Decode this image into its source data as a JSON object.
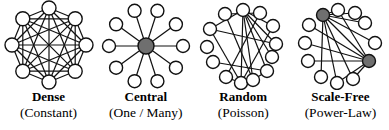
{
  "figure": {
    "colors": {
      "node_fill": "#ffffff",
      "node_stroke": "#111111",
      "edge_stroke": "#111111",
      "hub_fill": "#6f6f6f"
    },
    "panels": [
      {
        "id": "dense",
        "label": "Dense",
        "sublabel": "(Constant)",
        "graph": {
          "width": 96,
          "height": 90,
          "node_r": 7,
          "nodes": [
            {
              "x": 48,
              "y": 8
            },
            {
              "x": 74.2,
              "y": 18.8
            },
            {
              "x": 85,
              "y": 45
            },
            {
              "x": 74.2,
              "y": 71.2
            },
            {
              "x": 48,
              "y": 82
            },
            {
              "x": 21.8,
              "y": 71.2
            },
            {
              "x": 11,
              "y": 45
            },
            {
              "x": 21.8,
              "y": 18.8
            }
          ],
          "edges": [
            [
              0,
              1
            ],
            [
              0,
              2
            ],
            [
              0,
              3
            ],
            [
              0,
              4
            ],
            [
              0,
              5
            ],
            [
              0,
              6
            ],
            [
              0,
              7
            ],
            [
              1,
              2
            ],
            [
              1,
              3
            ],
            [
              1,
              4
            ],
            [
              1,
              5
            ],
            [
              1,
              6
            ],
            [
              1,
              7
            ],
            [
              2,
              3
            ],
            [
              2,
              4
            ],
            [
              2,
              5
            ],
            [
              2,
              6
            ],
            [
              2,
              7
            ],
            [
              3,
              4
            ],
            [
              3,
              5
            ],
            [
              3,
              6
            ],
            [
              3,
              7
            ],
            [
              4,
              5
            ],
            [
              4,
              6
            ],
            [
              4,
              7
            ],
            [
              5,
              6
            ],
            [
              5,
              7
            ],
            [
              6,
              7
            ]
          ]
        }
      },
      {
        "id": "central",
        "label": "Central",
        "sublabel": "(One / Many)",
        "graph": {
          "width": 96,
          "height": 90,
          "node_r": 6.5,
          "nodes": [
            {
              "x": 48,
              "y": 46,
              "hub": true,
              "r": 8
            },
            {
              "x": 85,
              "y": 46
            },
            {
              "x": 77.9,
              "y": 24.3
            },
            {
              "x": 59.4,
              "y": 10.8
            },
            {
              "x": 36.6,
              "y": 10.8
            },
            {
              "x": 18.1,
              "y": 24.3
            },
            {
              "x": 11,
              "y": 46
            },
            {
              "x": 18.1,
              "y": 67.7
            },
            {
              "x": 36.6,
              "y": 81.2
            },
            {
              "x": 59.4,
              "y": 81.2
            },
            {
              "x": 77.9,
              "y": 67.7
            }
          ],
          "edges": [
            [
              0,
              1
            ],
            [
              0,
              2
            ],
            [
              0,
              3
            ],
            [
              0,
              4
            ],
            [
              0,
              5
            ],
            [
              0,
              6
            ],
            [
              0,
              7
            ],
            [
              0,
              8
            ],
            [
              0,
              9
            ],
            [
              0,
              10
            ]
          ]
        }
      },
      {
        "id": "random",
        "label": "Random",
        "sublabel": "(Poisson)",
        "graph": {
          "width": 96,
          "height": 90,
          "node_r": 6.5,
          "nodes": [
            {
              "x": 48,
              "y": 10
            },
            {
              "x": 30,
              "y": 14
            },
            {
              "x": 65,
              "y": 13
            },
            {
              "x": 15,
              "y": 29
            },
            {
              "x": 78,
              "y": 26
            },
            {
              "x": 12,
              "y": 47
            },
            {
              "x": 81,
              "y": 44
            },
            {
              "x": 77,
              "y": 57
            },
            {
              "x": 18,
              "y": 62
            },
            {
              "x": 31,
              "y": 77
            },
            {
              "x": 46,
              "y": 83
            },
            {
              "x": 58,
              "y": 80
            },
            {
              "x": 72,
              "y": 71
            }
          ],
          "edges": [
            [
              0,
              3
            ],
            [
              0,
              4
            ],
            [
              0,
              6
            ],
            [
              0,
              7
            ],
            [
              0,
              10
            ],
            [
              0,
              11
            ],
            [
              0,
              12
            ],
            [
              1,
              2
            ],
            [
              1,
              11
            ],
            [
              2,
              9
            ],
            [
              3,
              6
            ],
            [
              3,
              10
            ],
            [
              4,
              10
            ],
            [
              8,
              12
            ],
            [
              9,
              10
            ],
            [
              10,
              11
            ],
            [
              11,
              12
            ]
          ]
        }
      },
      {
        "id": "scale-free",
        "label": "Scale-Free",
        "sublabel": "(Power-Law)",
        "graph": {
          "width": 96,
          "height": 90,
          "node_r": 6.5,
          "nodes": [
            {
              "x": 31,
              "y": 15,
              "hub": true
            },
            {
              "x": 46,
              "y": 10
            },
            {
              "x": 63,
              "y": 13
            },
            {
              "x": 73,
              "y": 23
            },
            {
              "x": 17,
              "y": 25
            },
            {
              "x": 13,
              "y": 43
            },
            {
              "x": 83,
              "y": 43
            },
            {
              "x": 77,
              "y": 61,
              "hub": true
            },
            {
              "x": 16,
              "y": 61
            },
            {
              "x": 29,
              "y": 77
            },
            {
              "x": 45,
              "y": 83
            },
            {
              "x": 61,
              "y": 79
            }
          ],
          "edges": [
            [
              0,
              1
            ],
            [
              0,
              2
            ],
            [
              0,
              3
            ],
            [
              0,
              6
            ],
            [
              0,
              7
            ],
            [
              0,
              9
            ],
            [
              0,
              10
            ],
            [
              0,
              11
            ],
            [
              1,
              7
            ],
            [
              4,
              7
            ],
            [
              5,
              7
            ],
            [
              8,
              7
            ],
            [
              10,
              7
            ],
            [
              11,
              7
            ]
          ]
        }
      }
    ]
  }
}
